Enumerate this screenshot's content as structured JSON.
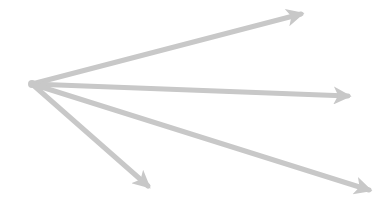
{
  "diagram": {
    "type": "arrow-fan",
    "width": 389,
    "height": 214,
    "background": "#ffffff",
    "color": "#c8c8c8",
    "stroke_width": 5,
    "origin": {
      "x": 32,
      "y": 84
    },
    "arrows": [
      {
        "id": "arrow-upper-right",
        "to": {
          "x": 301,
          "y": 14
        }
      },
      {
        "id": "arrow-right",
        "to": {
          "x": 348,
          "y": 96
        }
      },
      {
        "id": "arrow-lower-right",
        "to": {
          "x": 369,
          "y": 190
        }
      },
      {
        "id": "arrow-down-right",
        "to": {
          "x": 148,
          "y": 186
        }
      }
    ]
  }
}
